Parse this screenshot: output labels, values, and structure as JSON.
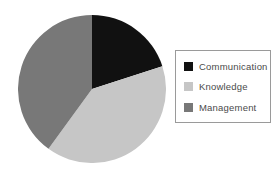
{
  "chart_data": {
    "type": "pie",
    "title": "",
    "labels": [
      "Communication",
      "Knowledge",
      "Management"
    ],
    "values": [
      20,
      40,
      40
    ],
    "colors": [
      "#111111",
      "#c6c6c6",
      "#787878"
    ],
    "start_angle_deg": 0,
    "direction": "clockwise",
    "legend_position": "right",
    "legend_border_color": "#9a9a9a",
    "legend_text_color": "#4a4a4a",
    "background_color": "#ffffff"
  }
}
